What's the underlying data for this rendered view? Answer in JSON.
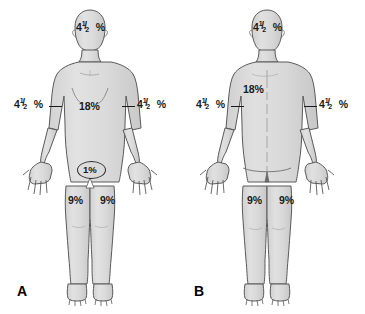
{
  "figure": {
    "panels": [
      {
        "letter": "A",
        "view": "anterior",
        "labels": {
          "head": {
            "whole": "4",
            "numerator": "1",
            "slash": "/",
            "denominator": "2",
            "percent": "%"
          },
          "left_arm": {
            "whole": "4",
            "numerator": "1",
            "slash": "/",
            "denominator": "2",
            "percent": "%"
          },
          "right_arm": {
            "whole": "4",
            "numerator": "1",
            "slash": "/",
            "denominator": "2",
            "percent": "%"
          },
          "trunk": "18%",
          "genitalia": "1%",
          "left_leg": "9%",
          "right_leg": "9%"
        }
      },
      {
        "letter": "B",
        "view": "posterior",
        "labels": {
          "head": {
            "whole": "4",
            "numerator": "1",
            "slash": "/",
            "denominator": "2",
            "percent": "%"
          },
          "left_arm": {
            "whole": "4",
            "numerator": "1",
            "slash": "/",
            "denominator": "2",
            "percent": "%"
          },
          "right_arm": {
            "whole": "4",
            "numerator": "1",
            "slash": "/",
            "denominator": "2",
            "percent": "%"
          },
          "trunk": "18%",
          "left_leg": "9%",
          "right_leg": "9%"
        }
      }
    ],
    "colors": {
      "body_fill": "#dcdcdc",
      "body_outline": "#5a5a5a",
      "text": "#1a1a1a",
      "background": "#ffffff"
    }
  }
}
